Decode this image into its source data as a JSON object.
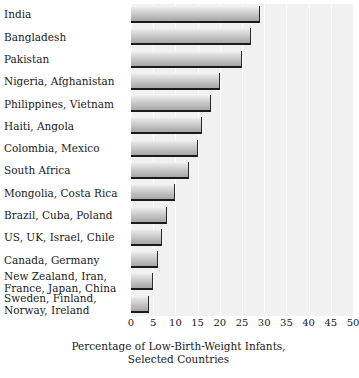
{
  "chart_data": {
    "type": "bar",
    "orientation": "horizontal",
    "title": "",
    "caption_line1": "Percentage of Low-Birth-Weight Infants,",
    "caption_line2": "Selected Countries",
    "xlabel": "Percentage of Low-Birth-Weight Infants, Selected Countries",
    "ylabel": "",
    "xlim": [
      0,
      50
    ],
    "xticks": [
      0,
      5,
      10,
      15,
      20,
      25,
      30,
      35,
      40,
      45,
      50
    ],
    "xtick_labels": [
      "0",
      "5",
      "10",
      "15",
      "20",
      "25",
      "30",
      "35",
      "40",
      "45",
      "50"
    ],
    "grid": true,
    "legend": false,
    "categories": [
      "India",
      "Bangladesh",
      "Pakistan",
      "Nigeria, Afghanistan",
      "Philippines, Vietnam",
      "Haiti, Angola",
      "Colombia, Mexico",
      "South Africa",
      "Mongolia, Costa Rica",
      "Brazil, Cuba, Poland",
      "US, UK, Israel, Chile",
      "Canada, Germany",
      "New Zealand, Iran,\nFrance, Japan, China",
      "Sweden, Finland,\nNorway, Ireland"
    ],
    "values": [
      29,
      27,
      25,
      20,
      18,
      16,
      15,
      13,
      10,
      8,
      7,
      6,
      5,
      4
    ]
  },
  "colors": {
    "plot_background": "#f1f1f1",
    "gridline": "#fdfdfd",
    "bar_light": "#f4f4f4",
    "bar_dark": "#a8a8a8",
    "bar_edge": "#1b1b1b",
    "text": "#1a1a1a",
    "page_background": "#ffffff"
  }
}
